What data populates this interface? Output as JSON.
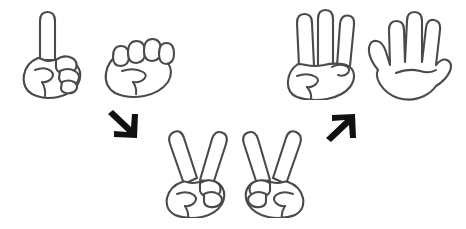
{
  "canvas": {
    "width": 466,
    "height": 229,
    "background_color": "#ffffff",
    "title": "Hand gesture counting diagram"
  },
  "style": {
    "hand_outline_color": "#4a4a4a",
    "hand_fill_color": "#ffffff",
    "hand_stroke_width": 2.1,
    "arrow_color": "#111111"
  },
  "figures": [
    {
      "id": "hand-one",
      "icon_name": "hand-one-finger-icon",
      "label": "one",
      "finger_count": 1,
      "orientation": "right",
      "x": 18,
      "y": 8,
      "width": 86,
      "height": 92
    },
    {
      "id": "hand-fist",
      "icon_name": "hand-fist-icon",
      "label": "zero",
      "finger_count": 0,
      "orientation": "right",
      "x": 100,
      "y": 33,
      "width": 82,
      "height": 68
    },
    {
      "id": "hand-three",
      "icon_name": "hand-three-fingers-icon",
      "label": "three",
      "finger_count": 3,
      "orientation": "right",
      "x": 284,
      "y": 8,
      "width": 86,
      "height": 92
    },
    {
      "id": "hand-five",
      "icon_name": "hand-open-palm-icon",
      "label": "five",
      "finger_count": 5,
      "orientation": "right",
      "x": 362,
      "y": 8,
      "width": 94,
      "height": 94
    },
    {
      "id": "hand-two-left",
      "icon_name": "hand-two-fingers-icon",
      "label": "two",
      "finger_count": 2,
      "orientation": "right",
      "x": 160,
      "y": 126,
      "width": 82,
      "height": 92
    },
    {
      "id": "hand-two-right",
      "icon_name": "hand-two-fingers-mirrored-icon",
      "label": "two",
      "finger_count": 2,
      "orientation": "left",
      "x": 228,
      "y": 126,
      "width": 82,
      "height": 92
    }
  ],
  "arrows": [
    {
      "id": "arrow-down-right",
      "icon_name": "arrow-down-right-icon",
      "direction": "down-right",
      "glyph": "↘",
      "x": 106,
      "y": 110,
      "width": 34,
      "height": 32
    },
    {
      "id": "arrow-up-right",
      "icon_name": "arrow-up-right-icon",
      "direction": "up-right",
      "glyph": "↗",
      "x": 324,
      "y": 110,
      "width": 34,
      "height": 32
    }
  ]
}
